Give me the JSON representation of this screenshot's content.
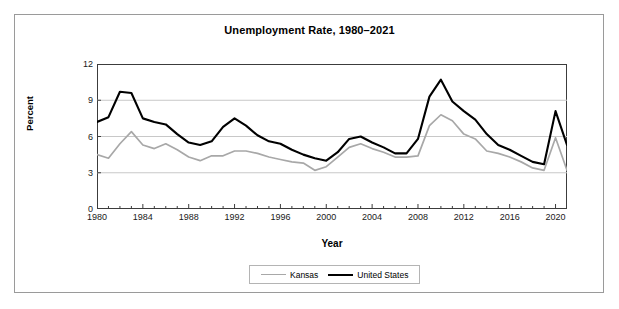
{
  "figure": {
    "title": "Unemployment Rate, 1980–2021"
  },
  "axes": {
    "y_title": "Percent",
    "x_title": "Year",
    "y_ticks": [
      "0",
      "3",
      "6",
      "9",
      "12"
    ],
    "x_ticks": [
      "1980",
      "1984",
      "1988",
      "1992",
      "1996",
      "2000",
      "2004",
      "2008",
      "2012",
      "2016",
      "2020"
    ]
  },
  "legend": {
    "items": [
      {
        "label": "Kansas",
        "color": "#a8a8a8"
      },
      {
        "label": "United States",
        "color": "#000000"
      }
    ]
  },
  "colors": {
    "kansas": "#a8a8a8",
    "united_states": "#000000",
    "gridline": "#c8c8c8",
    "axis": "#3c3c3c",
    "frame": "#9a9a9a"
  },
  "chart_data": {
    "type": "line",
    "title": "Unemployment Rate, 1980–2021",
    "xlabel": "Year",
    "ylabel": "Percent",
    "xlim": [
      1980,
      2021
    ],
    "ylim": [
      0,
      12
    ],
    "yticks": [
      0,
      3,
      6,
      9,
      12
    ],
    "xticks": [
      1980,
      1984,
      1988,
      1992,
      1996,
      2000,
      2004,
      2008,
      2012,
      2016,
      2020
    ],
    "grid": "horizontal",
    "legend_position": "bottom-center",
    "x": [
      1980,
      1981,
      1982,
      1983,
      1984,
      1985,
      1986,
      1987,
      1988,
      1989,
      1990,
      1991,
      1992,
      1993,
      1994,
      1995,
      1996,
      1997,
      1998,
      1999,
      2000,
      2001,
      2002,
      2003,
      2004,
      2005,
      2006,
      2007,
      2008,
      2009,
      2010,
      2011,
      2012,
      2013,
      2014,
      2015,
      2016,
      2017,
      2018,
      2019,
      2020,
      2021
    ],
    "series": [
      {
        "name": "United States",
        "color": "#000000",
        "values": [
          7.2,
          7.6,
          9.7,
          9.6,
          7.5,
          7.2,
          7.0,
          6.2,
          5.5,
          5.3,
          5.6,
          6.8,
          7.5,
          6.9,
          6.1,
          5.6,
          5.4,
          4.9,
          4.5,
          4.2,
          4.0,
          4.7,
          5.8,
          6.0,
          5.5,
          5.1,
          4.6,
          4.6,
          5.8,
          9.3,
          10.7,
          8.9,
          8.1,
          7.4,
          6.2,
          5.3,
          4.9,
          4.4,
          3.9,
          3.7,
          8.1,
          5.3
        ]
      },
      {
        "name": "Kansas",
        "color": "#a8a8a8",
        "values": [
          4.5,
          4.2,
          5.4,
          6.4,
          5.3,
          5.0,
          5.4,
          4.9,
          4.3,
          4.0,
          4.4,
          4.4,
          4.8,
          4.8,
          4.6,
          4.3,
          4.1,
          3.9,
          3.8,
          3.2,
          3.5,
          4.3,
          5.1,
          5.4,
          5.0,
          4.7,
          4.3,
          4.3,
          4.4,
          6.9,
          7.8,
          7.3,
          6.2,
          5.8,
          4.8,
          4.6,
          4.3,
          3.9,
          3.4,
          3.2,
          5.9,
          3.2
        ]
      }
    ]
  }
}
